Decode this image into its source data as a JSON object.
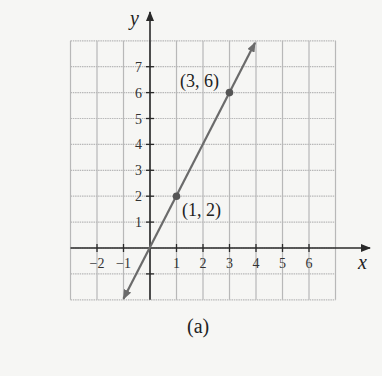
{
  "chart_data": {
    "type": "line",
    "title": "",
    "caption": "(a)",
    "xlabel": "x",
    "ylabel": "y",
    "xlim": [
      -3,
      7
    ],
    "ylim": [
      -2,
      8
    ],
    "grid": true,
    "x_ticks": [
      -2,
      -1,
      1,
      2,
      3,
      4,
      5,
      6
    ],
    "x_tick_labels": [
      "−2",
      "−1",
      "1",
      "2",
      "3",
      "4",
      "5",
      "6"
    ],
    "y_ticks": [
      1,
      2,
      3,
      4,
      5,
      6,
      7
    ],
    "y_tick_labels": [
      "1",
      "2",
      "3",
      "4",
      "5",
      "6",
      "7"
    ],
    "series": [
      {
        "name": "y = 2x",
        "equation": "y = 2x",
        "x": [
          -1,
          0,
          1,
          2,
          3,
          4
        ],
        "y": [
          -2,
          0,
          2,
          4,
          6,
          8
        ],
        "arrows": "both",
        "color": "#6b6b6b"
      }
    ],
    "points": [
      {
        "x": 1,
        "y": 2,
        "label": "(1, 2)"
      },
      {
        "x": 3,
        "y": 6,
        "label": "(3, 6)"
      }
    ]
  },
  "labels": {
    "x_axis": "x",
    "y_axis": "y",
    "point_a": "(1, 2)",
    "point_b": "(3, 6)",
    "caption": "(a)"
  },
  "colors": {
    "grid": "#b8b8b8",
    "axis": "#2a2a2a",
    "line": "#6b6b6b",
    "point": "#555555"
  }
}
